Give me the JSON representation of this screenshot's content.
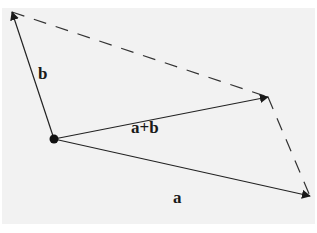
{
  "diagram": {
    "colors": {
      "background": "#f2f2f2",
      "stroke": "#222222"
    },
    "origin": {
      "x": 54,
      "y": 139
    },
    "vectors": [
      {
        "id": "a",
        "label": "a",
        "tip": {
          "x": 310,
          "y": 196
        },
        "label_pos": {
          "x": 178,
          "y": 201
        }
      },
      {
        "id": "b",
        "label": "b",
        "tip": {
          "x": 12,
          "y": 12
        },
        "label_pos": {
          "x": 42,
          "y": 77
        }
      },
      {
        "id": "sum",
        "label": "a+b",
        "tip": {
          "x": 268,
          "y": 97
        },
        "label_pos": {
          "x": 131,
          "y": 135
        }
      }
    ],
    "dashed_edges": [
      {
        "from": "b_tip",
        "to": "sum_tip"
      },
      {
        "from": "sum_tip",
        "to": "a_tip"
      }
    ]
  }
}
